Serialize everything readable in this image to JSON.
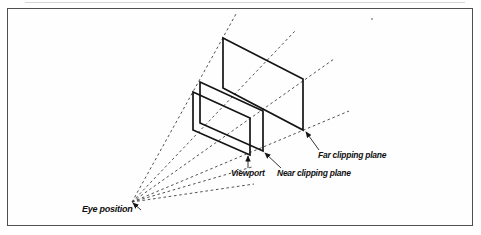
{
  "figure": {
    "labels": {
      "eye_position": "Eye position",
      "viewport": "Viewport",
      "near_plane": "Near clipping plane",
      "far_plane": "Far clipping plane"
    },
    "colors": {
      "background": "#ffffff",
      "frame": "#4f4f4f",
      "solid_line": "#141414",
      "dashed_line": "#3d3d3d",
      "callout_line": "#1c1c1c",
      "label_text": "#101010"
    },
    "geometry": {
      "eye": [
        132,
        202
      ],
      "planes": [
        {
          "name": "far-clipping-plane-rect",
          "points": [
            [
              223,
              38
            ],
            [
              303,
              79
            ],
            [
              303,
              130
            ],
            [
              223,
              88
            ]
          ]
        },
        {
          "name": "near-clipping-plane-rect",
          "points": [
            [
              200,
              82
            ],
            [
              263,
              111
            ],
            [
              263,
              151
            ],
            [
              200,
              123
            ]
          ]
        },
        {
          "name": "viewport-rect",
          "points": [
            [
              193,
              92
            ],
            [
              250,
              118
            ],
            [
              250,
              155
            ],
            [
              193,
              130
            ]
          ]
        }
      ],
      "rays": [
        {
          "name": "eye-ray-top-left",
          "to": [
            236,
            14
          ]
        },
        {
          "name": "eye-ray-bottom-left",
          "to": [
            295,
            31
          ]
        },
        {
          "name": "eye-ray-top-right",
          "to": [
            334,
            59
          ]
        },
        {
          "name": "eye-ray-bottom-right",
          "to": [
            349,
            111
          ]
        },
        {
          "name": "eye-ray-lower-mid",
          "to": [
            252,
            167
          ]
        },
        {
          "name": "eye-ray-lower",
          "to": [
            254,
            184
          ]
        }
      ],
      "callout_arrows": [
        {
          "name": "eye-position-arrow",
          "from": [
            141,
            210
          ],
          "to": [
            133,
            203
          ]
        },
        {
          "name": "viewport-arrow",
          "from": [
            248,
            168
          ],
          "to": [
            248,
            156
          ]
        },
        {
          "name": "near-plane-arrow",
          "from": [
            281,
            168
          ],
          "to": [
            265,
            153
          ]
        },
        {
          "name": "far-plane-arrow",
          "from": [
            319,
            150
          ],
          "to": [
            306,
            132
          ]
        }
      ]
    }
  }
}
